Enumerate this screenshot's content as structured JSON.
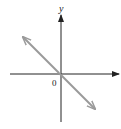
{
  "diagram": {
    "type": "coordinate-plane",
    "axes": {
      "x_label": "",
      "y_label": "y",
      "origin_label": "0"
    },
    "line": {
      "description": "line through origin with negative slope (y = -x)",
      "slope": -1,
      "intercept": 0,
      "color": "#9a9a9a",
      "arrows": "both"
    },
    "colors": {
      "axis": "#222222",
      "line": "#9a9a9a",
      "background": "#ffffff"
    }
  }
}
